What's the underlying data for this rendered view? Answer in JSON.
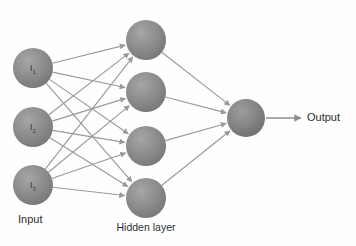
{
  "diagram": {
    "background_color": "#fefefe",
    "edge_color": "#9a9a9a",
    "node_fill_color": "#848484",
    "node_fill_color_light": "#9c9c9c",
    "node_text_color": "#3a3a3a",
    "caption_text_color": "#2e2e2e"
  },
  "captions": {
    "input": "Input",
    "hidden": "Hidden layer",
    "output": "Output"
  },
  "layers": {
    "input": {
      "name": "input-layer",
      "cx": 33,
      "r": 20,
      "nodes": [
        {
          "id": "i1",
          "label_main": "I",
          "label_sub": "1",
          "cy": 68
        },
        {
          "id": "i2",
          "label_main": "I",
          "label_sub": "2",
          "cy": 127
        },
        {
          "id": "i3",
          "label_main": "I",
          "label_sub": "3",
          "cy": 185
        }
      ]
    },
    "hidden": {
      "name": "hidden-layer",
      "cx": 146,
      "r": 20,
      "nodes": [
        {
          "id": "h1",
          "label_main": "",
          "label_sub": "",
          "cy": 40
        },
        {
          "id": "h2",
          "label_main": "",
          "label_sub": "",
          "cy": 92
        },
        {
          "id": "h3",
          "label_main": "",
          "label_sub": "",
          "cy": 146
        },
        {
          "id": "h4",
          "label_main": "",
          "label_sub": "",
          "cy": 198
        }
      ]
    },
    "output": {
      "name": "output-layer",
      "cx": 246,
      "r": 19,
      "nodes": [
        {
          "id": "o1",
          "label_main": "",
          "label_sub": "",
          "cy": 118
        }
      ]
    }
  },
  "caption_positions": {
    "input": {
      "x": 18,
      "y": 220
    },
    "hidden": {
      "x": 146,
      "y": 228
    },
    "output": {
      "x": 307,
      "y": 118
    }
  },
  "edges": {
    "input_to_hidden": [
      {
        "from": "i1",
        "to": "h1"
      },
      {
        "from": "i1",
        "to": "h2"
      },
      {
        "from": "i1",
        "to": "h3"
      },
      {
        "from": "i1",
        "to": "h4"
      },
      {
        "from": "i2",
        "to": "h1"
      },
      {
        "from": "i2",
        "to": "h2"
      },
      {
        "from": "i2",
        "to": "h3"
      },
      {
        "from": "i2",
        "to": "h4"
      },
      {
        "from": "i3",
        "to": "h1"
      },
      {
        "from": "i3",
        "to": "h2"
      },
      {
        "from": "i3",
        "to": "h3"
      },
      {
        "from": "i3",
        "to": "h4"
      }
    ],
    "hidden_to_output": [
      {
        "from": "h1",
        "to": "o1"
      },
      {
        "from": "h2",
        "to": "o1"
      },
      {
        "from": "h3",
        "to": "o1"
      },
      {
        "from": "h4",
        "to": "o1"
      }
    ],
    "output_arrow": {
      "x1": 266,
      "y1": 118,
      "x2": 301,
      "y2": 118
    }
  },
  "counts": {
    "input_nodes": 3,
    "hidden_nodes": 4,
    "output_nodes": 1,
    "total_edges": 16
  }
}
